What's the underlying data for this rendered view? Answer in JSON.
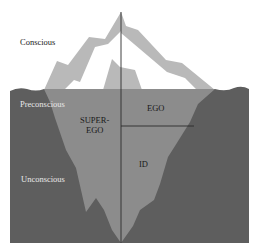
{
  "diagram": {
    "levels": {
      "conscious": "Conscious",
      "preconscious": "Preconscious",
      "unconscious": "Unconscious"
    },
    "structures": {
      "superego_line1": "SUPER-",
      "superego_line2": "EGO",
      "ego": "EGO",
      "id": "ID"
    },
    "colors": {
      "background": "#ffffff",
      "iceberg_above_band": "#b9b9b9",
      "iceberg_above_inner": "#ffffff",
      "water": "#5e5e5e",
      "iceberg_submerged": "#8c8c8c",
      "divider_line": "#2a2a2a"
    }
  }
}
